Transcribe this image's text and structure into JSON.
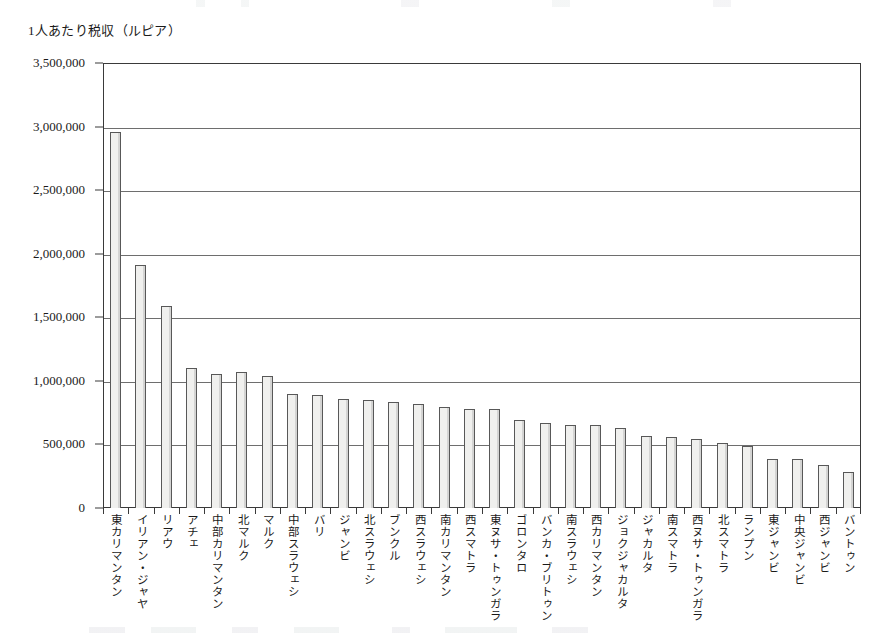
{
  "chart_data": {
    "type": "bar",
    "title": "",
    "ylabel": "1人あたり税収（ルピア）",
    "xlabel": "",
    "ylim": [
      0,
      3500000
    ],
    "ytick_labels": [
      "3,500,000",
      "3,000,000",
      "2,500,000",
      "2,000,000",
      "1,500,000",
      "1,000,000",
      "500,000",
      "0"
    ],
    "ytick_values": [
      3500000,
      3000000,
      2500000,
      2000000,
      1500000,
      1000000,
      500000,
      0
    ],
    "grid": true,
    "legend": "none",
    "categories": [
      "東カリマンタン",
      "イリアン・ジャヤ",
      "リアウ",
      "アチェ",
      "中部カリマンタン",
      "北マルク",
      "マルク",
      "中部スラウェシ",
      "バリ",
      "ジャンビ",
      "北スラウェシ",
      "ブンクル",
      "西スラウェシ",
      "南カリマンタン",
      "西スマトラ",
      "東ヌサ・トゥンガラ",
      "ゴロンタロ",
      "バンカ・ブリトゥン",
      "南スラウェシ",
      "西カリマンタン",
      "ジョクジャカルタ",
      "ジャカルタ",
      "南スマトラ",
      "西ヌサ・トゥンガラ",
      "北スマトラ",
      "ランプン",
      "東ジャンビ",
      "中央ジャンビ",
      "西ジャンビ",
      "バントゥン"
    ],
    "values": [
      2960000,
      1910000,
      1585000,
      1105000,
      1055000,
      1070000,
      1040000,
      900000,
      885000,
      855000,
      850000,
      830000,
      815000,
      795000,
      775000,
      775000,
      690000,
      670000,
      650000,
      655000,
      630000,
      570000,
      555000,
      545000,
      510000,
      490000,
      385000,
      385000,
      340000,
      280000
    ]
  }
}
